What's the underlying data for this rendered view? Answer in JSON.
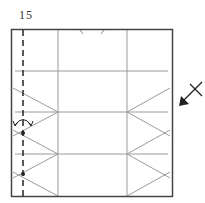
{
  "diagram": {
    "step_number": "15",
    "colors": {
      "frame": "#444444",
      "crease": "#9a9a9a",
      "dashed": "#222222",
      "arrow": "#222222"
    },
    "frame": {
      "x": 11,
      "y": 29,
      "width": 161,
      "height": 167
    },
    "valley_fold_line": {
      "x": 23,
      "y1": 29,
      "y2": 196,
      "style": "dashed"
    },
    "vertical_creases": [
      58,
      127
    ],
    "horizontal_creases": [
      71,
      112,
      154
    ],
    "reference_points": [
      {
        "x": 23,
        "y": 133
      },
      {
        "x": 23,
        "y": 174
      }
    ],
    "symbols": [
      {
        "type": "flip-arrow",
        "x": 23,
        "y": 120
      },
      {
        "type": "view-direction-arrow",
        "x": 191,
        "y": 93
      },
      {
        "type": "edge-tick-marks",
        "x": [
          82,
          102
        ],
        "y": 29
      }
    ]
  }
}
